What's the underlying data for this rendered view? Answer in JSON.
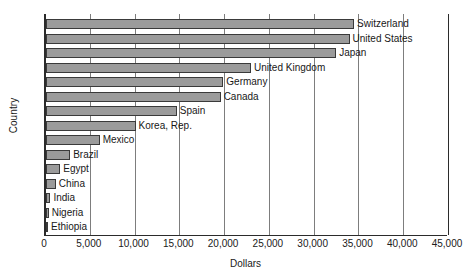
{
  "chart_data": {
    "type": "bar",
    "orientation": "horizontal",
    "title": "",
    "xlabel": "Dollars",
    "ylabel": "Country",
    "xlim": [
      0,
      45000
    ],
    "xticks": [
      "0",
      "5,000",
      "10,000",
      "15,000",
      "20,000",
      "25,000",
      "30,000",
      "35,000",
      "40,000",
      "45,000"
    ],
    "xtick_values": [
      0,
      5000,
      10000,
      15000,
      20000,
      25000,
      30000,
      35000,
      40000,
      45000
    ],
    "grid": true,
    "legend": "none",
    "bar_color": "#9b9b9b",
    "bar_border_color": "#3a3a3a",
    "axis_color": "#2b2b2b",
    "gridline_color": "#7d7d7d",
    "categories": [
      "Switzerland",
      "United States",
      "Japan",
      "United Kingdom",
      "Germany",
      "Canada",
      "Spain",
      "Korea, Rep.",
      "Mexico",
      "Brazil",
      "Egypt",
      "China",
      "India",
      "Nigeria",
      "Ethiopia"
    ],
    "values": [
      34400,
      33900,
      32400,
      22900,
      19800,
      19500,
      14600,
      10000,
      6000,
      2700,
      1600,
      1100,
      500,
      300,
      100
    ]
  }
}
